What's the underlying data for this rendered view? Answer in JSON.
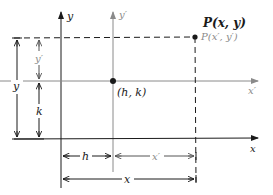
{
  "diagram": {
    "type": "coordinate-translation",
    "colors": {
      "primary": "#1a1a1a",
      "secondary": "#8a8a8a"
    },
    "axes": {
      "x_label": "x",
      "y_label": "y",
      "x_prime_label": "x′",
      "y_prime_label": "y′"
    },
    "points": {
      "origin_prime_label": "(h, k)",
      "p_label": "P(x, y)",
      "p_prime_label": "P(x′, y′)"
    },
    "dimensions": {
      "y_total": "y",
      "y_prime": "y′",
      "k": "k",
      "h": "h",
      "x_prime": "x′",
      "x_total": "x"
    }
  }
}
